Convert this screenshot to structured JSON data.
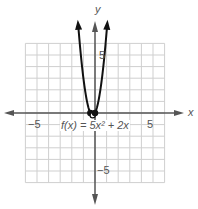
{
  "chart_data": {
    "type": "line",
    "title": "",
    "function_label": "f(x) = 5x² + 2x",
    "xlabel": "x",
    "ylabel": "y",
    "xlim": [
      -6,
      6
    ],
    "ylim": [
      -6,
      6
    ],
    "grid": true,
    "tick_labels": {
      "x": [
        "-5",
        "5"
      ],
      "y": [
        "5",
        "-5"
      ]
    },
    "series": [
      {
        "name": "f(x) = 5x^2 + 2x",
        "equation": "5x^2 + 2x",
        "x": [
          -1.4,
          -1.2,
          -1.0,
          -0.8,
          -0.6,
          -0.4,
          -0.2,
          0.0,
          0.2,
          0.4,
          0.6,
          0.8,
          1.0
        ],
        "y": [
          7.0,
          4.8,
          3.0,
          1.6,
          0.6,
          0.0,
          -0.2,
          0.0,
          0.6,
          1.6,
          3.0,
          4.8,
          7.0
        ]
      }
    ],
    "marked_points": [
      {
        "x": -0.4,
        "y": 0,
        "style": "filled"
      },
      {
        "x": -0.2,
        "y": -0.2,
        "style": "open"
      },
      {
        "x": 0,
        "y": 0,
        "style": "filled"
      }
    ],
    "colors": {
      "curve": "#111111",
      "axis": "#555555",
      "grid": "#cfcfcf"
    }
  },
  "labels": {
    "x_axis": "x",
    "y_axis": "y",
    "x_neg5": "−5",
    "x_pos5": "5",
    "y_pos5": "5",
    "y_neg5": "−5",
    "function": "f(x) = 5x² + 2x"
  }
}
